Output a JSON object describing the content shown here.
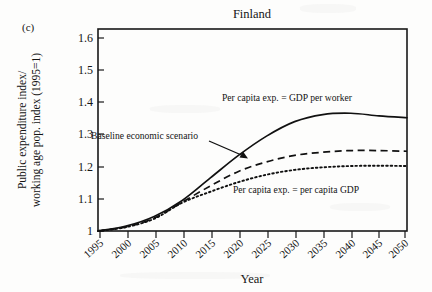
{
  "figure": {
    "panel_label": "(c)",
    "title": "Finland"
  },
  "chart_data": {
    "type": "line",
    "title": "Finland",
    "panel": "(c)",
    "xlabel": "Year",
    "ylabel": "Public expenditure index/ working age pop. index (1995=1)",
    "ylabel_line1": "Public expenditure index/",
    "ylabel_line2": "working age pop. index (1995=1)",
    "xlim": [
      1995,
      2050
    ],
    "ylim": [
      1.0,
      1.65
    ],
    "grid": false,
    "legend": "none (in-plot annotations)",
    "xticks": [
      "1995",
      "2000",
      "2005",
      "2010",
      "2015",
      "2020",
      "2025",
      "2030",
      "2035",
      "2040",
      "2045",
      "2050"
    ],
    "yticks": [
      "1",
      "1.1",
      "1.2",
      "1.3",
      "1.4",
      "1.5",
      "1.6"
    ],
    "x": [
      1995,
      2000,
      2005,
      2010,
      2015,
      2020,
      2025,
      2030,
      2035,
      2040,
      2045,
      2050
    ],
    "series": [
      {
        "name": "Per capita exp. = GDP per worker",
        "style": "solid",
        "values": [
          1.0,
          1.015,
          1.045,
          1.095,
          1.165,
          1.235,
          1.295,
          1.34,
          1.362,
          1.366,
          1.358,
          1.352
        ]
      },
      {
        "name": "Baseline economic scenario",
        "style": "dashed",
        "values": [
          1.0,
          1.013,
          1.04,
          1.09,
          1.14,
          1.185,
          1.215,
          1.235,
          1.245,
          1.25,
          1.25,
          1.248
        ]
      },
      {
        "name": "Per capita exp. = per capita GDP",
        "style": "dotted",
        "values": [
          1.0,
          1.012,
          1.038,
          1.088,
          1.122,
          1.152,
          1.175,
          1.19,
          1.198,
          1.202,
          1.203,
          1.202
        ]
      }
    ],
    "annotations": [
      {
        "name": "solid-curve-label",
        "text": "Per capita exp. = GDP per worker",
        "x": 2022,
        "y": 1.43
      },
      {
        "name": "dashed-curve-label",
        "text": "Baseline economic scenario",
        "x": 2008,
        "y": 1.3,
        "has_arrow": true
      },
      {
        "name": "dotted-curve-label",
        "text": "Per capita exp. = per capita GDP",
        "x": 2027,
        "y": 1.105
      }
    ]
  }
}
